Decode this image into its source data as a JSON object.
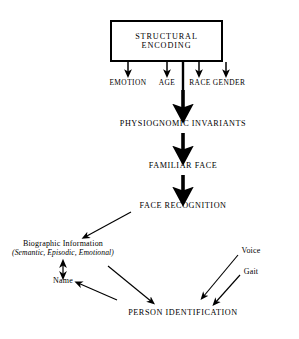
{
  "diagram": {
    "type": "flowchart",
    "background_color": "#ffffff",
    "ink_color": "#000000",
    "nodes": {
      "structural_encoding": "STRUCTURAL ENCODING",
      "emotion": "EMOTION",
      "age": "AGE",
      "race": "RACE",
      "gender": "GENDER",
      "physiognomic_invariants": "PHYSIOGNOMIC INVARIANTS",
      "familiar_face": "FAMILIAR FACE",
      "face_recognition": "FACE RECOGNITION",
      "biographic_information": "Biographic Information",
      "biographic_qualifiers": "(Semantic, Episodic, Emotional)",
      "name": "Name",
      "voice": "Voice",
      "gait": "Gait",
      "person_identification": "PERSON IDENTIFICATION"
    },
    "edges": [
      {
        "from": "structural_encoding",
        "to": "emotion",
        "style": "thin-down-arrow"
      },
      {
        "from": "structural_encoding",
        "to": "age",
        "style": "thin-down-arrow"
      },
      {
        "from": "structural_encoding",
        "to": "race",
        "style": "thin-down-arrow"
      },
      {
        "from": "structural_encoding",
        "to": "gender",
        "style": "thin-down-arrow"
      },
      {
        "from": "structural_encoding",
        "to": "physiognomic_invariants",
        "style": "thick-down-arrow"
      },
      {
        "from": "physiognomic_invariants",
        "to": "familiar_face",
        "style": "thick-down-arrow"
      },
      {
        "from": "familiar_face",
        "to": "face_recognition",
        "style": "thick-down-arrow"
      },
      {
        "from": "face_recognition",
        "to": "biographic_information",
        "style": "diagonal-arrow"
      },
      {
        "from": "biographic_information",
        "to": "name",
        "style": "double-headed-arrow"
      },
      {
        "from": "biographic_information",
        "to": "person_identification",
        "style": "diagonal-arrow"
      },
      {
        "from": "name",
        "to": "person_identification",
        "style": "diagonal-arrow-reverse"
      },
      {
        "from": "voice",
        "to": "person_identification",
        "style": "diagonal-arrow"
      },
      {
        "from": "gait",
        "to": "person_identification",
        "style": "diagonal-arrow"
      }
    ]
  }
}
